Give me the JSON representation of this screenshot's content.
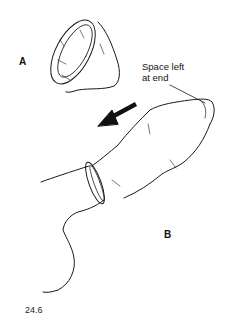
{
  "figure": {
    "panel_a_label": "A",
    "panel_b_label": "B",
    "annotation": {
      "line1": "Space left",
      "line2": "at end"
    },
    "figure_number": "24.6",
    "colors": {
      "line": "#1a1a1a",
      "arrow": "#111111",
      "background": "#ffffff"
    }
  }
}
